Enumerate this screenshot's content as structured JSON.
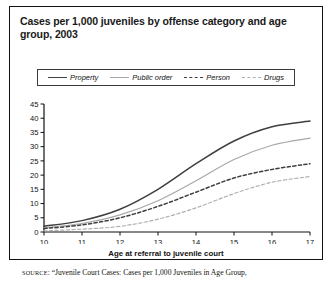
{
  "title": "Cases per 1,000 juveniles by offense category and age group, 2003",
  "axis_title_x": "Age at referral to juvenile court",
  "source": {
    "keyword": "SOURCE",
    "text": ": “Juvenile Court Cases: Cases per 1,000 Juveniles in Age Group,"
  },
  "legend": {
    "items": [
      {
        "label": "Property",
        "icon": "solid-line-dark-swatch",
        "color": "#3f3f3f",
        "style": "solid"
      },
      {
        "label": "Public order",
        "icon": "solid-line-light-swatch",
        "color": "#a8a8a8",
        "style": "solid"
      },
      {
        "label": "Person",
        "icon": "dashed-line-dark-swatch",
        "color": "#3f3f3f",
        "style": "dashed"
      },
      {
        "label": "Drugs",
        "icon": "dashed-line-light-swatch",
        "color": "#b0b0b0",
        "style": "dashed"
      }
    ]
  },
  "chart_data": {
    "type": "line",
    "title": "Cases per 1,000 juveniles by offense category and age group, 2003",
    "xlabel": "Age at referral to juvenile court",
    "ylabel": "",
    "xlim": [
      10,
      17
    ],
    "ylim": [
      0,
      45
    ],
    "grid": false,
    "legend_position": "top",
    "x": [
      10,
      11,
      12,
      13,
      14,
      15,
      16,
      17
    ],
    "xticklabels": [
      "10",
      "11",
      "12",
      "13",
      "14",
      "15",
      "16",
      "17"
    ],
    "yticks": [
      0,
      5,
      10,
      15,
      20,
      25,
      30,
      35,
      40,
      45
    ],
    "yticklabels": [
      "0",
      "5",
      "10",
      "15",
      "20",
      "25",
      "30",
      "35",
      "40",
      "45"
    ],
    "series": [
      {
        "name": "Property",
        "color": "#3f3f3f",
        "style": "solid",
        "values": [
          2.0,
          4.0,
          8.0,
          15.0,
          24.0,
          32.0,
          37.0,
          39.0
        ]
      },
      {
        "name": "Public order",
        "color": "#a8a8a8",
        "style": "solid",
        "values": [
          1.5,
          3.0,
          6.0,
          11.0,
          18.0,
          25.5,
          30.5,
          33.0
        ]
      },
      {
        "name": "Person",
        "color": "#3f3f3f",
        "style": "dashed",
        "values": [
          1.2,
          2.5,
          5.0,
          9.0,
          14.0,
          19.0,
          22.0,
          24.0
        ]
      },
      {
        "name": "Drugs",
        "color": "#b0b0b0",
        "style": "dashed",
        "values": [
          0.4,
          1.0,
          2.0,
          4.5,
          8.5,
          13.5,
          17.5,
          19.5
        ]
      }
    ]
  }
}
